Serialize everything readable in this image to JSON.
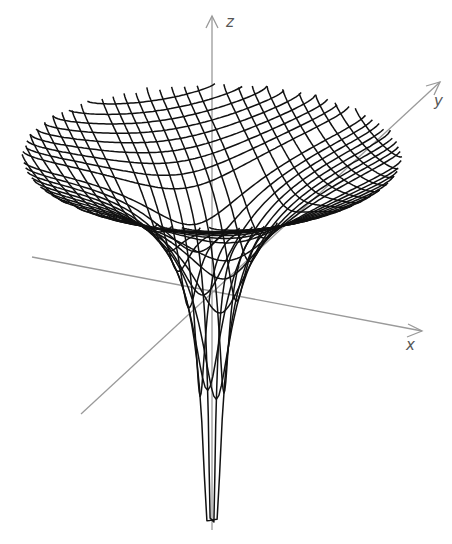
{
  "chart_data": {
    "type": "surface3d",
    "title": "",
    "axes": {
      "x": {
        "label": "x"
      },
      "y": {
        "label": "y"
      },
      "z": {
        "label": "z"
      }
    },
    "grid": false,
    "legend": null,
    "mesh": {
      "u_lines": 30,
      "v_lines": 30,
      "rim_center_px": [
        212,
        155
      ],
      "rim_radius_px": [
        190,
        72
      ],
      "bottom_px": [
        210,
        520
      ]
    }
  },
  "colors": {
    "mesh": "#111111",
    "axes": "#9a9a9a",
    "labels": "#555555",
    "background": "#ffffff"
  }
}
